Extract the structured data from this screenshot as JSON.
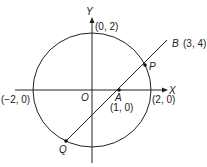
{
  "diagram": {
    "axes": {
      "x_label": "X",
      "y_label": "Y",
      "origin_label": "O"
    },
    "circle": {
      "center": "O",
      "radius": 2
    },
    "axis_points": {
      "top": "(0, 2)",
      "left": "(−2, 0)",
      "right": "(2, 0)"
    },
    "points": {
      "A": {
        "name": "A",
        "coords": "(1, 0)"
      },
      "B": {
        "name": "B",
        "coords": "(3, 4)"
      },
      "P": {
        "name": "P"
      },
      "Q": {
        "name": "Q"
      }
    },
    "colors": {
      "stroke": "#222222",
      "background": "#ffffff"
    }
  }
}
